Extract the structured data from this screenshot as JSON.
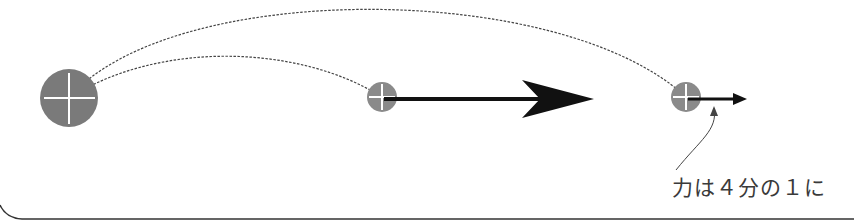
{
  "diagram": {
    "type": "physics-illustration",
    "colors": {
      "body_fill": "#7a7a7a",
      "crosshair": "#ffffff",
      "arrow": "#111111",
      "dashed_line": "#444444",
      "text": "#3a3a3a",
      "border": "#333333"
    },
    "nodes": [
      {
        "id": "source-body",
        "cx": 69,
        "cy": 98,
        "r": 29,
        "label": ""
      },
      {
        "id": "near-body",
        "cx": 382,
        "cy": 97,
        "r": 15,
        "label": ""
      },
      {
        "id": "far-body",
        "cx": 686,
        "cy": 97,
        "r": 15,
        "label": ""
      }
    ],
    "arrows": [
      {
        "id": "large-force-arrow",
        "from_x": 382,
        "to_x": 592,
        "y": 99
      },
      {
        "id": "small-force-arrow",
        "from_x": 690,
        "to_x": 746,
        "y": 99
      }
    ],
    "annotation": {
      "text": "力は４分の１に",
      "points_to": "small-force-arrow"
    }
  }
}
